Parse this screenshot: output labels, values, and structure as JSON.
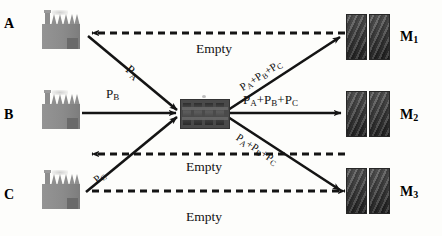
{
  "diagram": {
    "colors": {
      "line": "#141414",
      "factory": "#8d8d8d",
      "hub": "#4a4a4a",
      "market": "#333333",
      "background": "#fdfdfb"
    }
  },
  "sources": [
    {
      "id": "A",
      "label": "A",
      "icon": "factory-icon"
    },
    {
      "id": "B",
      "label": "B",
      "icon": "factory-icon"
    },
    {
      "id": "C",
      "label": "C",
      "icon": "factory-icon"
    }
  ],
  "hub": {
    "id": "hub",
    "icon": "warehouse-icon"
  },
  "markets": [
    {
      "id": "M1",
      "label": "M",
      "sub": "1",
      "icon": "market-icon"
    },
    {
      "id": "M2",
      "label": "M",
      "sub": "2",
      "icon": "market-icon"
    },
    {
      "id": "M3",
      "label": "M",
      "sub": "3",
      "icon": "market-icon"
    }
  ],
  "inbound_labels": [
    {
      "id": "pa",
      "p": "P",
      "sub": "A"
    },
    {
      "id": "pb",
      "p": "P",
      "sub": "B"
    },
    {
      "id": "pc",
      "p": "P",
      "sub": "C"
    }
  ],
  "outbound_labels": [
    {
      "id": "m1_load",
      "text_parts": [
        "P",
        "A",
        "+P",
        "B",
        "+P",
        "C"
      ]
    },
    {
      "id": "m2_load",
      "text_parts": [
        "P",
        "A",
        "+P",
        "B",
        "+P",
        "C"
      ]
    },
    {
      "id": "m3_load",
      "text_parts": [
        "P",
        "A",
        "+P",
        "B",
        "+P",
        "C"
      ]
    }
  ],
  "load_pieces": {
    "p": "P",
    "a": "A",
    "b": "B",
    "c": "C",
    "plus": "+"
  },
  "return_labels": [
    {
      "id": "empty_top",
      "text": "Empty"
    },
    {
      "id": "empty_mid",
      "text": "Empty"
    },
    {
      "id": "empty_bottom",
      "text": "Empty"
    }
  ]
}
